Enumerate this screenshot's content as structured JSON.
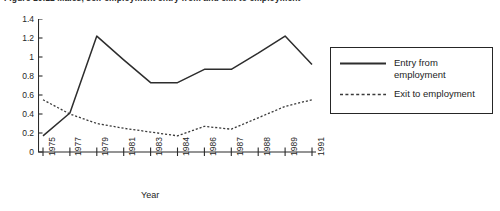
{
  "figure": {
    "caption": "Figure 10.12   Males, self-employment entry from and exit to employment"
  },
  "chart_data": {
    "type": "line",
    "title": "",
    "xlabel": "Year",
    "ylabel": "",
    "x": [
      1975,
      1977,
      1979,
      1981,
      1983,
      1984,
      1986,
      1987,
      1988,
      1989,
      1991
    ],
    "xtick_labels": [
      "1975",
      "1977",
      "1979",
      "1981",
      "1983",
      "1984",
      "1986",
      "1987",
      "1988",
      "1989",
      "1991"
    ],
    "ytick_labels": [
      "0",
      "0.2",
      "0.4",
      "0.6",
      "0.8",
      "1",
      "1.2",
      "1.4"
    ],
    "yticks": [
      0,
      0.2,
      0.4,
      0.6,
      0.8,
      1.0,
      1.2,
      1.4
    ],
    "ylim": [
      0,
      1.4
    ],
    "grid": false,
    "legend_position": "right",
    "series": [
      {
        "name": "Entry from\nemployment",
        "style": "solid",
        "color": "#2d2d2d",
        "values": [
          0.17,
          0.41,
          1.22,
          0.97,
          0.73,
          0.73,
          0.87,
          0.87,
          1.04,
          1.22,
          0.92
        ]
      },
      {
        "name": "Exit to employment",
        "style": "dotted",
        "color": "#3a3a3a",
        "values": [
          0.55,
          0.4,
          0.3,
          0.25,
          0.21,
          0.17,
          0.27,
          0.24,
          0.36,
          0.48,
          0.55
        ]
      }
    ]
  },
  "legend": {
    "items": [
      {
        "label": "Entry from\nemployment",
        "style": "solid"
      },
      {
        "label": "Exit to employment",
        "style": "dotted"
      }
    ]
  }
}
